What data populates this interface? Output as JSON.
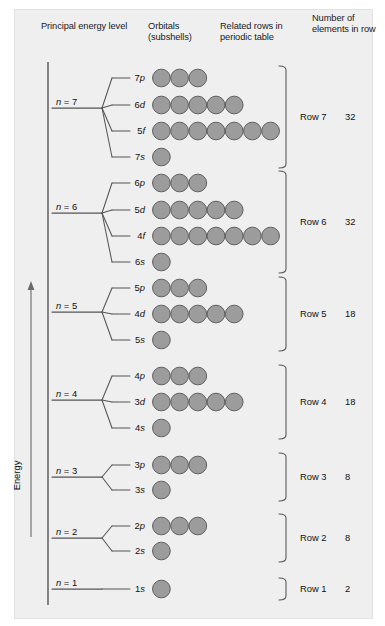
{
  "figure": {
    "background": "#efefef",
    "axis_label": "Energy",
    "orbital_fill": "#9c9c9c",
    "orbital_stroke": "#5f5f5f",
    "line_color": "#555555"
  },
  "headers": {
    "principal": "Principal energy level",
    "orbitals": "Orbitals (subshells)",
    "related": "Related rows in periodic table",
    "number": "Number of elements in row"
  },
  "chart_data": {
    "type": "diagram",
    "xlabel": "",
    "ylabel": "Energy",
    "groups": [
      {
        "n_label": "n = 7",
        "n": 7,
        "row_label": "Row 7",
        "element_count": "32",
        "orbitals": [
          {
            "label": "7p",
            "n": "7",
            "letter": "p",
            "circles": 3
          },
          {
            "label": "6d",
            "n": "6",
            "letter": "d",
            "circles": 5
          },
          {
            "label": "5f",
            "n": "5",
            "letter": "f",
            "circles": 7
          },
          {
            "label": "7s",
            "n": "7",
            "letter": "s",
            "circles": 1
          }
        ]
      },
      {
        "n_label": "n = 6",
        "n": 6,
        "row_label": "Row 6",
        "element_count": "32",
        "orbitals": [
          {
            "label": "6p",
            "n": "6",
            "letter": "p",
            "circles": 3
          },
          {
            "label": "5d",
            "n": "5",
            "letter": "d",
            "circles": 5
          },
          {
            "label": "4f",
            "n": "4",
            "letter": "f",
            "circles": 7
          },
          {
            "label": "6s",
            "n": "6",
            "letter": "s",
            "circles": 1
          }
        ]
      },
      {
        "n_label": "n = 5",
        "n": 5,
        "row_label": "Row 5",
        "element_count": "18",
        "orbitals": [
          {
            "label": "5p",
            "n": "5",
            "letter": "p",
            "circles": 3
          },
          {
            "label": "4d",
            "n": "4",
            "letter": "d",
            "circles": 5
          },
          {
            "label": "5s",
            "n": "5",
            "letter": "s",
            "circles": 1
          }
        ]
      },
      {
        "n_label": "n = 4",
        "n": 4,
        "row_label": "Row 4",
        "element_count": "18",
        "orbitals": [
          {
            "label": "4p",
            "n": "4",
            "letter": "p",
            "circles": 3
          },
          {
            "label": "3d",
            "n": "3",
            "letter": "d",
            "circles": 5
          },
          {
            "label": "4s",
            "n": "4",
            "letter": "s",
            "circles": 1
          }
        ]
      },
      {
        "n_label": "n = 3",
        "n": 3,
        "row_label": "Row 3",
        "element_count": "8",
        "orbitals": [
          {
            "label": "3p",
            "n": "3",
            "letter": "p",
            "circles": 3
          },
          {
            "label": "3s",
            "n": "3",
            "letter": "s",
            "circles": 1
          }
        ]
      },
      {
        "n_label": "n = 2",
        "n": 2,
        "row_label": "Row 2",
        "element_count": "8",
        "orbitals": [
          {
            "label": "2p",
            "n": "2",
            "letter": "p",
            "circles": 3
          },
          {
            "label": "2s",
            "n": "2",
            "letter": "s",
            "circles": 1
          }
        ]
      },
      {
        "n_label": "n = 1",
        "n": 1,
        "row_label": "Row 1",
        "element_count": "2",
        "orbitals": [
          {
            "label": "1s",
            "n": "1",
            "letter": "s",
            "circles": 1
          }
        ]
      }
    ]
  }
}
